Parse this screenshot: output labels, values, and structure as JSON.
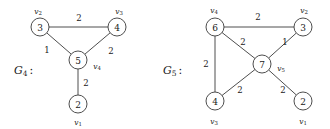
{
  "figure": {
    "background_color": "#ffffff",
    "stroke_color": "#3a3a3a",
    "text_color": "#1a1a1a"
  },
  "graphs": [
    {
      "id": "G4",
      "caption_base": "G",
      "caption_sub": "4",
      "caption_colon": ":",
      "caption_x": 14,
      "caption_y": 70,
      "nodes": [
        {
          "id": "n3",
          "value": "3",
          "vertex_base": "v",
          "vertex_sub": "2",
          "cx": 40,
          "cy": 27,
          "r": 9,
          "label_x": 38,
          "label_y": 11
        },
        {
          "id": "n4",
          "value": "4",
          "vertex_base": "v",
          "vertex_sub": "3",
          "cx": 117,
          "cy": 27,
          "r": 9,
          "label_x": 119,
          "label_y": 11
        },
        {
          "id": "n5",
          "value": "5",
          "vertex_base": "v",
          "vertex_sub": "4",
          "cx": 78,
          "cy": 60,
          "r": 9,
          "label_x": 97,
          "label_y": 66
        },
        {
          "id": "n2",
          "value": "2",
          "vertex_base": "v",
          "vertex_sub": "1",
          "cx": 78,
          "cy": 104,
          "r": 9,
          "label_x": 78,
          "label_y": 122
        }
      ],
      "edges": [
        {
          "from": "n3",
          "to": "n4",
          "weight": "2",
          "wx": 79,
          "wy": 18
        },
        {
          "from": "n3",
          "to": "n5",
          "weight": "1",
          "wx": 47,
          "wy": 50
        },
        {
          "from": "n4",
          "to": "n5",
          "weight": "2",
          "wx": 111,
          "wy": 51
        },
        {
          "from": "n5",
          "to": "n2",
          "weight": "2",
          "wx": 86,
          "wy": 83
        }
      ]
    },
    {
      "id": "G5",
      "caption_base": "G",
      "caption_sub": "5",
      "caption_colon": ":",
      "caption_x": 163,
      "caption_y": 70,
      "nodes": [
        {
          "id": "m6",
          "value": "6",
          "vertex_base": "v",
          "vertex_sub": "4",
          "cx": 215,
          "cy": 27,
          "r": 9,
          "label_x": 214,
          "label_y": 10
        },
        {
          "id": "m3",
          "value": "3",
          "vertex_base": "v",
          "vertex_sub": "2",
          "cx": 303,
          "cy": 27,
          "r": 9,
          "label_x": 304,
          "label_y": 10
        },
        {
          "id": "m7",
          "value": "7",
          "vertex_base": "v",
          "vertex_sub": "5",
          "cx": 262,
          "cy": 64,
          "r": 9,
          "label_x": 281,
          "label_y": 68
        },
        {
          "id": "m4",
          "value": "4",
          "vertex_base": "v",
          "vertex_sub": "3",
          "cx": 215,
          "cy": 101,
          "r": 9,
          "label_x": 214,
          "label_y": 121
        },
        {
          "id": "m2",
          "value": "2",
          "vertex_base": "v",
          "vertex_sub": "1",
          "cx": 303,
          "cy": 101,
          "r": 9,
          "label_x": 303,
          "label_y": 121
        }
      ],
      "edges": [
        {
          "from": "m6",
          "to": "m3",
          "weight": "2",
          "wx": 258,
          "wy": 17
        },
        {
          "from": "m6",
          "to": "m7",
          "weight": "2",
          "wx": 243,
          "wy": 42
        },
        {
          "from": "m6",
          "to": "m4",
          "weight": "2",
          "wx": 206,
          "wy": 64
        },
        {
          "from": "m3",
          "to": "m7",
          "weight": "1",
          "wx": 285,
          "wy": 42
        },
        {
          "from": "m7",
          "to": "m4",
          "weight": "2",
          "wx": 240,
          "wy": 90
        },
        {
          "from": "m7",
          "to": "m2",
          "weight": "2",
          "wx": 283,
          "wy": 90
        }
      ]
    }
  ]
}
